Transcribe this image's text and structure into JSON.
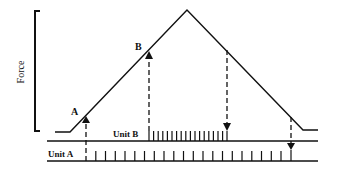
{
  "diagram": {
    "y_axis_label": "Force",
    "point_labels": {
      "a": "A",
      "b": "B"
    },
    "rows": [
      {
        "label": "Unit B"
      },
      {
        "label": "Unit A"
      }
    ],
    "colors": {
      "ink": "#111111",
      "background": "#ffffff"
    }
  }
}
